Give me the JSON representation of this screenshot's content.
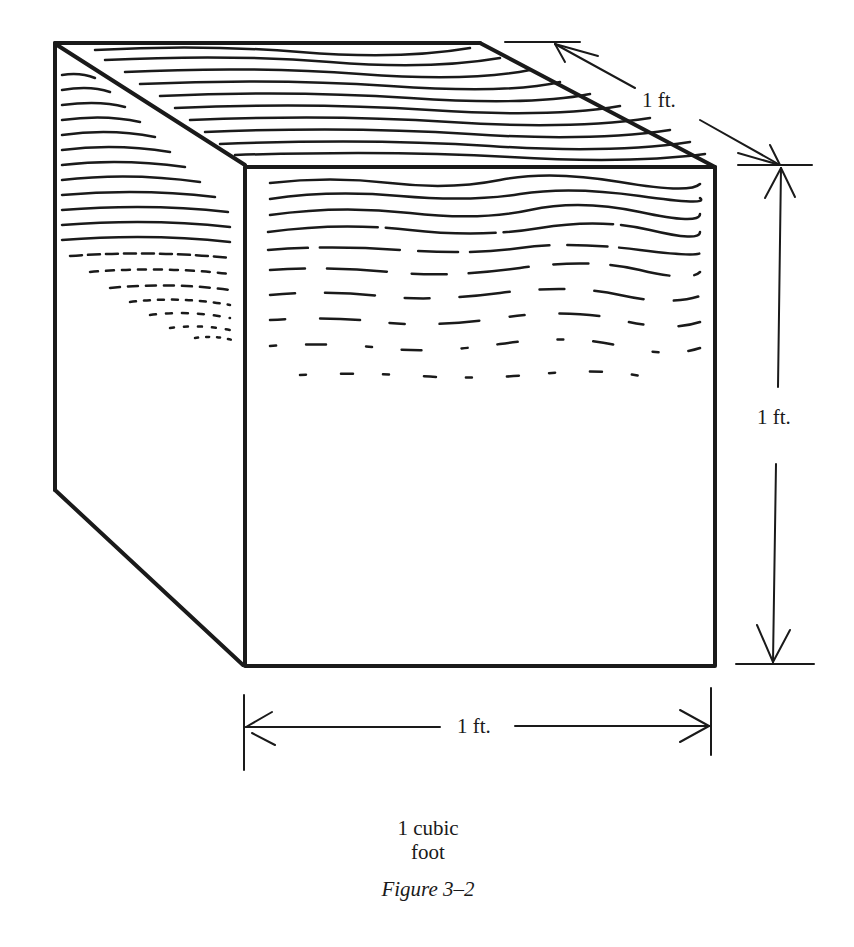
{
  "figure": {
    "caption_line1": "1 cubic",
    "caption_line2": "foot",
    "figure_label": "Figure 3–2"
  },
  "dimensions": {
    "depth_label": "1 ft.",
    "height_label": "1 ft.",
    "width_label": "1 ft."
  },
  "colors": {
    "ink": "#1a1a1a",
    "background": "#ffffff"
  }
}
